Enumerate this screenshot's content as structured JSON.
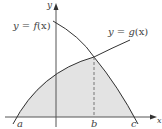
{
  "diagram": {
    "type": "area-between-curves",
    "curves": [
      {
        "name": "f",
        "label_prefix": "y = ",
        "label_func": "f",
        "label_var": "(x)"
      },
      {
        "name": "g",
        "label_prefix": "y = ",
        "label_func": "g",
        "label_var": "(x)"
      }
    ],
    "axes": {
      "x_label": "x",
      "y_label": "y"
    },
    "points": {
      "a": "a",
      "b": "b",
      "c": "c"
    },
    "shading": {
      "color": "#e3e3e3",
      "region": "under g from a to b, under f from b to c"
    },
    "colors": {
      "curve": "#333333",
      "axis": "#555555",
      "dashed": "#777777",
      "text": "#444444"
    }
  }
}
